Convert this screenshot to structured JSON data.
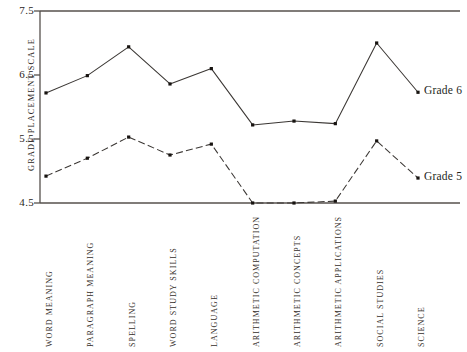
{
  "chart_data": {
    "type": "line",
    "title": "",
    "xlabel": "",
    "ylabel": "GRADE  PLACEMENT  SCALE",
    "ylim": [
      4.5,
      7.5
    ],
    "yticks": [
      4.5,
      5.5,
      6.5,
      7.5
    ],
    "ytick_labels": [
      "4.5",
      "5.5",
      "6.5",
      "7.5"
    ],
    "grid": false,
    "legend": "inline-right",
    "categories": [
      "WORD MEANING",
      "PARAGRAPH MEANING",
      "SPELLING",
      "WORD STUDY SKILLS",
      "LANGUAGE",
      "ARITHMETIC COMPUTATION",
      "ARITHMETIC CONCEPTS",
      "ARITHMETIC APPLICATIONS",
      "SOCIAL STUDIES",
      "SCIENCE"
    ],
    "series": [
      {
        "name": "Grade 6",
        "style": "solid",
        "color": "#3b3734",
        "values": [
          6.22,
          6.49,
          6.94,
          6.36,
          6.6,
          5.72,
          5.78,
          5.74,
          7.0,
          6.23
        ]
      },
      {
        "name": "Grade 5",
        "style": "dashed",
        "color": "#3b3734",
        "values": [
          4.92,
          5.2,
          5.53,
          5.25,
          5.42,
          4.5,
          4.5,
          4.53,
          5.47,
          4.89
        ]
      }
    ],
    "annotations": [
      {
        "text": "Grade 6",
        "series": "Grade 6",
        "at_category": "SCIENCE"
      },
      {
        "text": "Grade 5",
        "series": "Grade 5",
        "at_category": "SCIENCE"
      }
    ]
  },
  "axis": {
    "line_color": "#56514d",
    "tick_color": "#56514d"
  }
}
